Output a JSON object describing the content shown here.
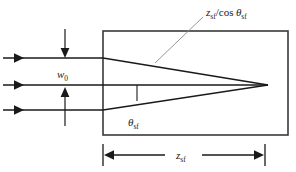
{
  "figure": {
    "name": "gaussian-beam-focusing-diagram",
    "background_color": "#ffffff",
    "line_color": "#1a1a1a",
    "box_color": "#3a3a3a",
    "leader_color": "#8a8a8a"
  },
  "labels": {
    "hypotenuse": {
      "text": "z_sf/cos θ_sf",
      "var1": "z",
      "sub1": "sf",
      "operator": "/cos",
      "var2": "θ",
      "sub2": "sf"
    },
    "beam_waist": {
      "text": "w_0",
      "var": "w",
      "sub": "0"
    },
    "angle": {
      "text": "θ_sf",
      "var": "θ",
      "sub": "sf"
    },
    "distance": {
      "text": "z_sf",
      "var": "z",
      "sub": "sf"
    }
  },
  "elements": {
    "incoming_rays": [
      {
        "name": "ray-top",
        "y": 58,
        "x_start": 3,
        "x_end": 103
      },
      {
        "name": "ray-middle",
        "y": 85,
        "x_start": 3,
        "x_end": 103
      },
      {
        "name": "ray-bottom",
        "y": 110,
        "x_start": 3,
        "x_end": 103
      }
    ],
    "waist_arrows": [
      {
        "name": "waist-arrow-down",
        "x": 65,
        "y_start": 29,
        "y_end": 57,
        "direction": "down"
      },
      {
        "name": "waist-arrow-up",
        "x": 65,
        "y_start": 126,
        "y_end": 90,
        "direction": "up"
      }
    ],
    "medium_box": {
      "x": 103,
      "y": 31,
      "width": 185,
      "height": 104
    },
    "focus_point": {
      "x": 268,
      "y": 85
    },
    "converging_rays": [
      {
        "name": "converging-ray-upper",
        "x1": 103,
        "y1": 58,
        "x2": 268,
        "y2": 85
      },
      {
        "name": "converging-ray-lower",
        "x1": 103,
        "y1": 110,
        "x2": 268,
        "y2": 85
      },
      {
        "name": "axis-ray",
        "x1": 103,
        "y1": 85,
        "x2": 268,
        "y2": 85
      }
    ],
    "angle_tick": {
      "x": 137,
      "y_top": 85,
      "y_bottom": 101
    },
    "leader_line": {
      "x1": 155,
      "y1": 63,
      "x2": 203,
      "y2": 17
    },
    "dimension_line": {
      "y": 155,
      "x_left": 103,
      "x_right": 265,
      "tick_height": 20
    }
  }
}
